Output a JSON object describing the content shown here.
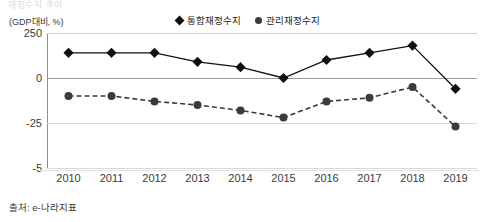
{
  "cut_title": "재정수지 추이",
  "axis_unit_label": "(GDP대비, %)",
  "source_note": "출처: e-나라지표",
  "legend": {
    "items": [
      {
        "label": "통합재정수지",
        "marker": "diamond-marker-icon",
        "color": "#111111",
        "style": "solid"
      },
      {
        "label": "관리재정수지",
        "marker": "circle-marker-icon",
        "color": "#3b3b3b",
        "style": "dashed"
      }
    ]
  },
  "chart_data": {
    "type": "line",
    "title": "재정수지 추이",
    "xlabel": "",
    "ylabel": "(GDP대비, %)",
    "x": [
      "2010",
      "2011",
      "2012",
      "2013",
      "2014",
      "2015",
      "2016",
      "2017",
      "2018",
      "2019"
    ],
    "ytick_labels": [
      "250",
      "0",
      "-25",
      "-5"
    ],
    "ytick_values": [
      25,
      0,
      -25,
      -50
    ],
    "ylim": [
      -50,
      25
    ],
    "grid": true,
    "legend_position": "top-center",
    "series": [
      {
        "name": "통합재정수지",
        "marker": "diamond",
        "line_style": "solid",
        "color": "#111111",
        "values": [
          14,
          14,
          14,
          9,
          6,
          0,
          10,
          14,
          18,
          -6
        ]
      },
      {
        "name": "관리재정수지",
        "marker": "circle",
        "line_style": "dashed",
        "color": "#3b3b3b",
        "values": [
          -10,
          -10,
          -13,
          -15,
          -18,
          -22,
          -13,
          -11,
          -5,
          -27
        ]
      }
    ]
  }
}
